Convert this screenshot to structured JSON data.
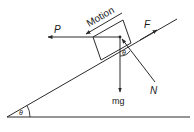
{
  "diagram": {
    "labels": {
      "motion": "Motion",
      "P": "P",
      "F": "F",
      "mg": "mg",
      "N": "N",
      "theta_block": "θ",
      "theta_base": "θ"
    },
    "colors": {
      "stroke": "#2a2a2a",
      "background": "#ffffff"
    }
  }
}
